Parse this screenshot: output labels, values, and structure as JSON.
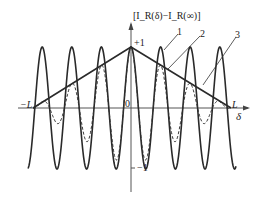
{
  "diagram": {
    "y_axis_label": "[I_R(δ)−I_R(∞)]",
    "x_axis_label": "δ",
    "origin_label": "0",
    "plus_one_label": "+1",
    "minus_one_label": "−1",
    "left_limit_label": "−L",
    "right_limit_label": "L",
    "curve_labels": [
      "1",
      "2",
      "3"
    ],
    "curves": [
      {
        "id": "1",
        "description": "cosine interference curve, amplitude ±1",
        "style": "solid"
      },
      {
        "id": "2",
        "description": "triangular envelope from −L to +1 at 0 to L",
        "style": "solid"
      },
      {
        "id": "3",
        "description": "damped interference curve bounded by envelope",
        "style": "dashed"
      }
    ],
    "colors": {
      "line": "#2a2a2a",
      "background": "#ffffff"
    }
  }
}
